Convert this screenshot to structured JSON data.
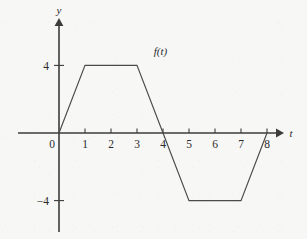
{
  "chart_data": {
    "type": "line",
    "title": "",
    "subtitle": "",
    "xlabel": "t",
    "ylabel": "y",
    "series_label": "f(t)",
    "x": [
      0,
      1,
      3,
      4,
      5,
      7,
      8
    ],
    "values": [
      0,
      4,
      4,
      0,
      -4,
      -4,
      0
    ],
    "xlim": [
      -1.6,
      8.5
    ],
    "ylim": [
      -5.9,
      6.5
    ],
    "x_ticks": [
      0,
      1,
      2,
      3,
      4,
      5,
      6,
      7,
      8
    ],
    "x_tick_labels": [
      "0",
      "1",
      "2",
      "3",
      "4",
      "5",
      "6",
      "7",
      "8"
    ],
    "y_ticks": [
      4,
      -4
    ],
    "y_tick_labels": [
      "4",
      "−4"
    ],
    "grid": false,
    "legend": "none",
    "annotations": [
      {
        "text": "f(t)",
        "x": 3.9,
        "y": 4.6
      }
    ],
    "line_color": "#4a4a4a",
    "axis_color": "#3c3c3c",
    "background_color": "#f7f7f6"
  }
}
